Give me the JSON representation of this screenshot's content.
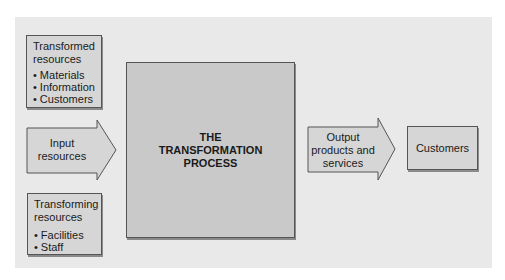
{
  "diagram": {
    "transformed_resources": {
      "title": [
        "Transformed",
        "resources"
      ],
      "items": [
        "Materials",
        "Information",
        "Customers"
      ]
    },
    "input_resources": {
      "label": [
        "Input",
        "resources"
      ]
    },
    "transforming_resources": {
      "title": [
        "Transforming",
        "resources"
      ],
      "items": [
        "Facilities",
        "Staff"
      ]
    },
    "process": {
      "label": [
        "THE",
        "TRANSFORMATION",
        "PROCESS"
      ]
    },
    "output": {
      "label": [
        "Output",
        "products and",
        "services"
      ]
    },
    "customers": {
      "label": "Customers"
    },
    "colors": {
      "panel": "#e9e9e9",
      "box_fill": "#d6d6d6",
      "process_fill": "#c9c9c9",
      "border": "#555555"
    }
  }
}
